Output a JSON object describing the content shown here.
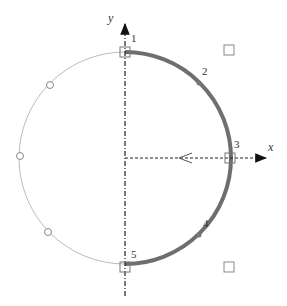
{
  "diagram": {
    "axes": {
      "x_label": "x",
      "y_label": "y"
    },
    "points": [
      {
        "id": "1",
        "label": "1"
      },
      {
        "id": "2",
        "label": "2"
      },
      {
        "id": "3",
        "label": "3"
      },
      {
        "id": "4",
        "label": "4"
      },
      {
        "id": "5",
        "label": "5"
      }
    ],
    "colors": {
      "thick_arc": "#6e6e6e",
      "thin_arc": "#bbbbbb",
      "axis": "#222222"
    }
  }
}
